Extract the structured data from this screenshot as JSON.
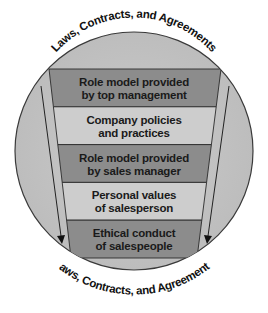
{
  "diagram": {
    "title_top": "Laws, Contracts, and Agreements",
    "title_bottom": "Laws, Contracts, and Agreements",
    "colors": {
      "circle_fill": "#c6c6c6",
      "circle_stroke": "#3a3a3a",
      "band_dark": "#8c8c8c",
      "band_light": "#cdcdcd",
      "band_stroke": "#2a2a2a",
      "arrow": "#222222"
    },
    "bands": [
      {
        "line1": "Role model provided",
        "line2": "by top management",
        "shade": "dark"
      },
      {
        "line1": "Company policies",
        "line2": "and practices",
        "shade": "light"
      },
      {
        "line1": "Role model provided",
        "line2": "by sales manager",
        "shade": "dark"
      },
      {
        "line1": "Personal values",
        "line2": "of salesperson",
        "shade": "light"
      },
      {
        "line1": "Ethical conduct",
        "line2": "of salespeople",
        "shade": "dark"
      }
    ]
  }
}
